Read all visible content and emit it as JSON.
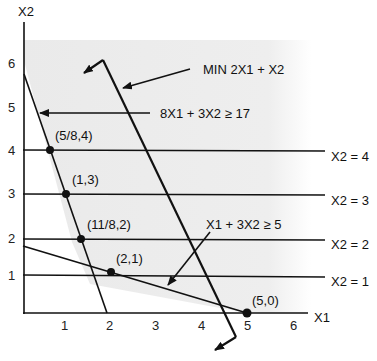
{
  "axes": {
    "x_label": "X1",
    "y_label": "X2",
    "x_ticks": [
      "1",
      "2",
      "3",
      "4",
      "5",
      "6"
    ],
    "y_ticks": [
      "1",
      "2",
      "3",
      "4",
      "5",
      "6"
    ]
  },
  "constraints": {
    "c1": "8X1 + 3X2  ≥  17",
    "c2": "X1 + 3X2  ≥  5",
    "objective": "MIN 2X1 + X2"
  },
  "horizontal_lines": {
    "h4": "X2 = 4",
    "h3": "X2 = 3",
    "h2": "X2 = 2",
    "h1": "X2 = 1"
  },
  "points": {
    "p1": "(5/8,4)",
    "p2": "(1,3)",
    "p3": "(11/8,2)",
    "p4": "(2,1)",
    "p5": "(5,0)"
  },
  "colors": {
    "feasible_region": "#ececec",
    "line": "#111111"
  }
}
